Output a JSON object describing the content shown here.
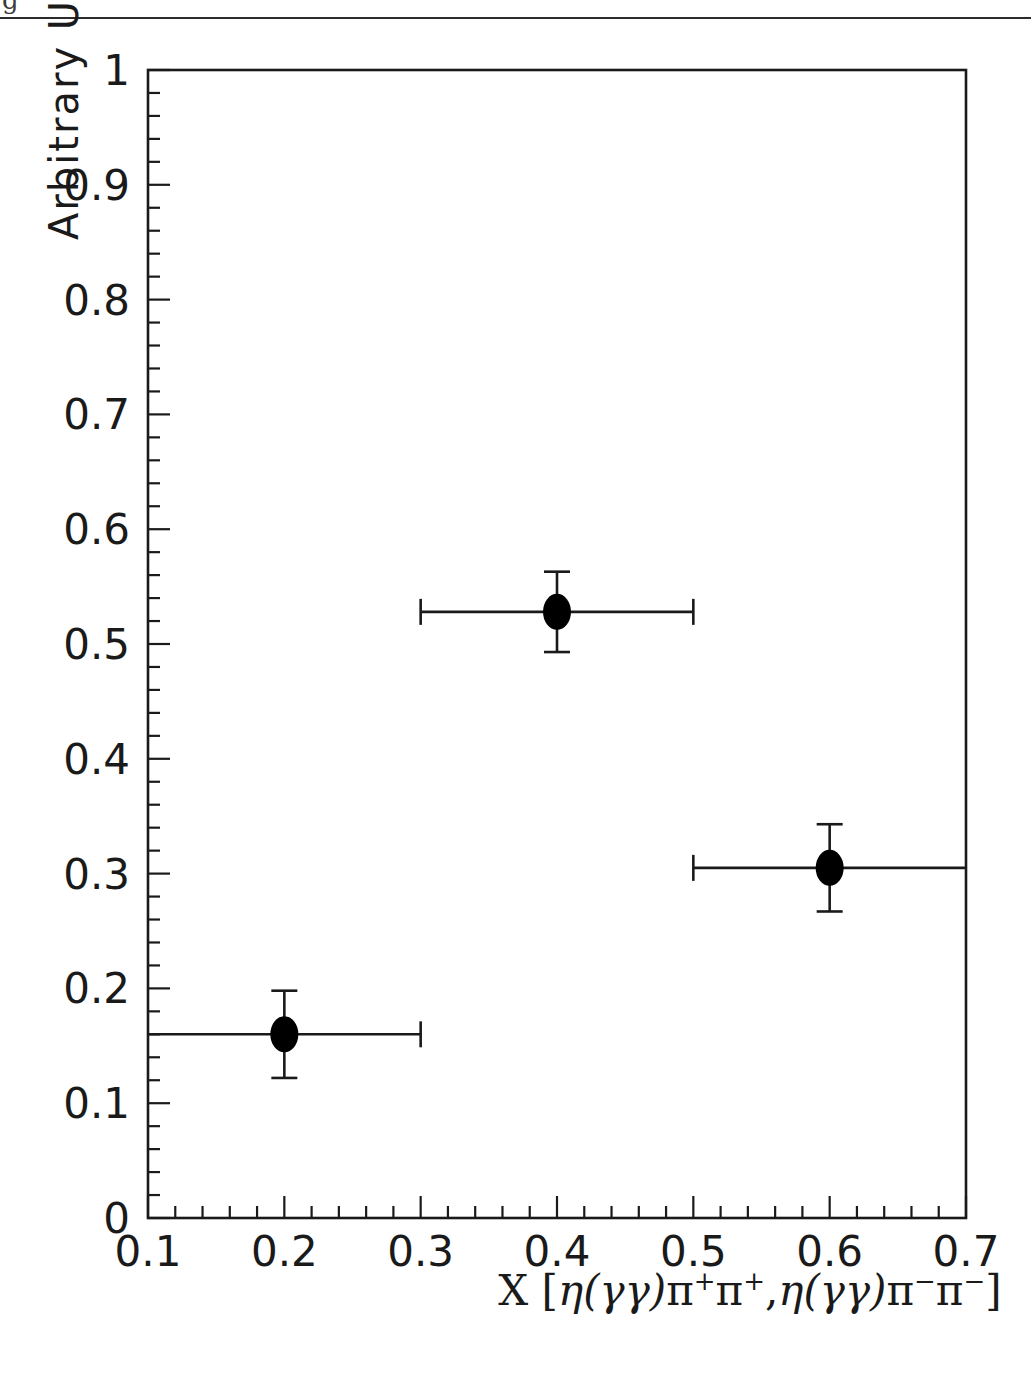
{
  "figure": {
    "top_rule_present": true,
    "corner_glyph": "g"
  },
  "chart_data": {
    "type": "scatter",
    "title": "",
    "xlabel": "X [η(γγ)π⁺π⁺,η(γγ)π⁻π⁻]",
    "ylabel": "Arbitrary Units",
    "xlim": [
      0.1,
      0.7
    ],
    "ylim": [
      0,
      1
    ],
    "grid": false,
    "legend": null,
    "xticks": [
      "0.1",
      "0.2",
      "0.3",
      "0.4",
      "0.5",
      "0.6",
      "0.7"
    ],
    "xtick_values": [
      0.1,
      0.2,
      0.3,
      0.4,
      0.5,
      0.6,
      0.7
    ],
    "yticks": [
      "0",
      "0.1",
      "0.2",
      "0.3",
      "0.4",
      "0.5",
      "0.6",
      "0.7",
      "0.8",
      "0.9",
      "1"
    ],
    "ytick_values": [
      0,
      0.1,
      0.2,
      0.3,
      0.4,
      0.5,
      0.6,
      0.7,
      0.8,
      0.9,
      1
    ],
    "x_minor_per_major": 5,
    "y_minor_per_major": 5,
    "marker": "filled-ellipse",
    "marker_color": "#000000",
    "points": [
      {
        "x": 0.2,
        "y": 0.16,
        "yerr": 0.038,
        "xerr_low": 0.1,
        "xerr_high": 0.1,
        "cap_low": false,
        "cap_high": true
      },
      {
        "x": 0.4,
        "y": 0.528,
        "yerr": 0.035,
        "xerr_low": 0.1,
        "xerr_high": 0.1,
        "cap_low": true,
        "cap_high": true
      },
      {
        "x": 0.6,
        "y": 0.305,
        "yerr": 0.038,
        "xerr_low": 0.1,
        "xerr_high": 0.1,
        "cap_low": true,
        "cap_high": false
      }
    ]
  },
  "axis_title_parts": {
    "x_prefix": "X [",
    "eta1": "η",
    "gg1": "(γγ)",
    "pi1": "π",
    "sup1": "+",
    "pi2": "π",
    "sup2": "+",
    "comma": ",",
    "eta2": "η",
    "gg2": "(γγ)",
    "pi3": "π",
    "sup3": "−",
    "pi4": "π",
    "sup4": "−",
    "suffix": "]"
  }
}
